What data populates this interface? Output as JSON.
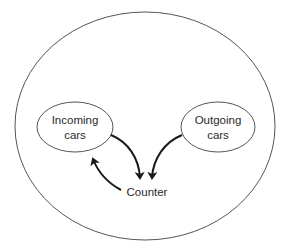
{
  "diagram": {
    "type": "flow",
    "outer_boundary": {
      "shape": "ellipse",
      "stroke": "#555555"
    },
    "nodes": [
      {
        "id": "incoming",
        "lines": [
          "Incoming",
          "cars"
        ],
        "shape": "ellipse"
      },
      {
        "id": "outgoing",
        "lines": [
          "Outgoing",
          "cars"
        ],
        "shape": "ellipse"
      },
      {
        "id": "counter",
        "lines": [
          "Counter"
        ],
        "shape": "text"
      }
    ],
    "edges": [
      {
        "from": "incoming",
        "to": "counter"
      },
      {
        "from": "outgoing",
        "to": "counter"
      },
      {
        "from": "counter",
        "to": "incoming"
      }
    ],
    "colors": {
      "stroke": "#555555",
      "arrow": "#1a1a1a",
      "text": "#2a2a2a",
      "background": "#ffffff"
    }
  }
}
